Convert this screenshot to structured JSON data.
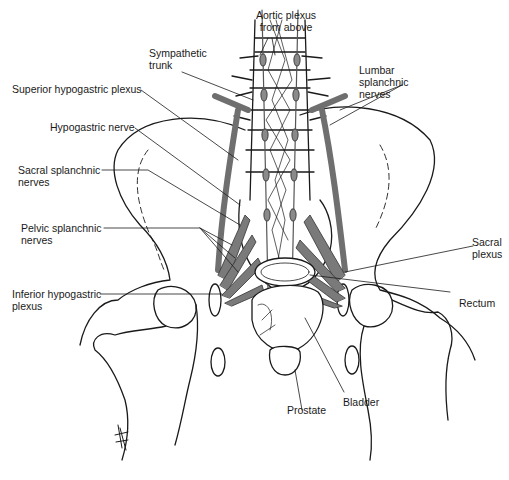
{
  "diagram": {
    "colors": {
      "line": "#1a1a1a",
      "nerve_fill": "#7a7a7a",
      "background": "#ffffff"
    },
    "labels": {
      "aortic_plexus": {
        "line1": "Aortic plexus",
        "line2": "from above"
      },
      "sympathetic_trunk": {
        "line1": "Sympathetic",
        "line2": "trunk"
      },
      "lumbar_splanchnic": {
        "line1": "Lumbar",
        "line2": "splanchnic",
        "line3": "nerves"
      },
      "superior_hypogastric": {
        "line1": "Superior hypogastric plexus"
      },
      "hypogastric_nerve": {
        "line1": "Hypogastric nerve"
      },
      "sacral_splanchnic": {
        "line1": "Sacral splanchnic",
        "line2": "nerves"
      },
      "pelvic_splanchnic": {
        "line1": "Pelvic splanchnic",
        "line2": "nerves"
      },
      "sacral_plexus": {
        "line1": "Sacral",
        "line2": "plexus"
      },
      "inferior_hypogastric": {
        "line1": "Inferior hypogastric",
        "line2": "plexus"
      },
      "rectum": {
        "line1": "Rectum"
      },
      "bladder": {
        "line1": "Bladder"
      },
      "prostate": {
        "line1": "Prostate"
      }
    }
  }
}
